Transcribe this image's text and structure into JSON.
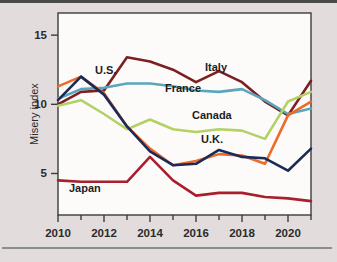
{
  "chart_data": {
    "type": "line",
    "title": "",
    "subtitle": "",
    "xlabel": "",
    "ylabel": "Misery index",
    "xlim": [
      2010,
      2021
    ],
    "ylim": [
      2.0,
      16.6
    ],
    "grid": false,
    "legend_position": "inline-annotations",
    "x": [
      2010,
      2011,
      2012,
      2013,
      2014,
      2015,
      2016,
      2017,
      2018,
      2019,
      2020,
      2021
    ],
    "x_tick_labels": [
      "2010",
      "2012",
      "2014",
      "2016",
      "2018",
      "2020"
    ],
    "x_ticks": [
      2010,
      2012,
      2014,
      2016,
      2018,
      2020
    ],
    "y_ticks": [
      5,
      10,
      15
    ],
    "y_tick_labels": [
      "5",
      "10",
      "15"
    ],
    "series": [
      {
        "name": "Italy",
        "color": "#7b1f21",
        "label": "Italy",
        "values": [
          10.0,
          10.9,
          11.0,
          13.4,
          13.1,
          12.5,
          11.6,
          12.4,
          11.6,
          10.2,
          9.2,
          11.7
        ]
      },
      {
        "name": "France",
        "color": "#5aa6bd",
        "label": "France",
        "values": [
          10.4,
          11.1,
          11.2,
          11.5,
          11.5,
          11.3,
          11.0,
          10.9,
          11.1,
          10.3,
          9.3,
          9.7
        ]
      },
      {
        "name": "Canada",
        "color": "#b4d166",
        "label": "Canada",
        "values": [
          9.9,
          10.3,
          9.3,
          8.2,
          8.9,
          8.2,
          8.0,
          8.2,
          8.1,
          7.5,
          10.2,
          10.9
        ]
      },
      {
        "name": "U.S.",
        "color": "#ed6a28",
        "label": "U.S.",
        "values": [
          11.3,
          12.0,
          10.8,
          8.4,
          6.8,
          5.6,
          5.9,
          6.4,
          6.3,
          5.7,
          9.2,
          10.2
        ]
      },
      {
        "name": "U.K.",
        "color": "#1b2a58",
        "label": "U.K.",
        "values": [
          10.3,
          12.0,
          10.7,
          8.4,
          6.6,
          5.6,
          5.7,
          6.7,
          6.2,
          6.1,
          5.2,
          6.8
        ]
      },
      {
        "name": "Japan",
        "color": "#a81f2e",
        "label": "Japan",
        "values": [
          4.5,
          4.4,
          4.4,
          4.4,
          6.2,
          4.5,
          3.4,
          3.6,
          3.6,
          3.3,
          3.2,
          3.0
        ]
      }
    ],
    "annotations": [
      {
        "text": "U.S.",
        "x_px": 95,
        "y_px": 74
      },
      {
        "text": "France",
        "x_px": 165,
        "y_px": 92
      },
      {
        "text": "Italy",
        "x_px": 205,
        "y_px": 71
      },
      {
        "text": "Canada",
        "x_px": 192,
        "y_px": 119
      },
      {
        "text": "U.K.",
        "x_px": 201,
        "y_px": 143
      },
      {
        "text": "Japan",
        "x_px": 69,
        "y_px": 192
      }
    ]
  },
  "colors": {
    "page_background": "#e3dcdc",
    "plot_background": "#fdfbfa",
    "axis": "#3b3b3b",
    "text": "#2b2b2b"
  }
}
